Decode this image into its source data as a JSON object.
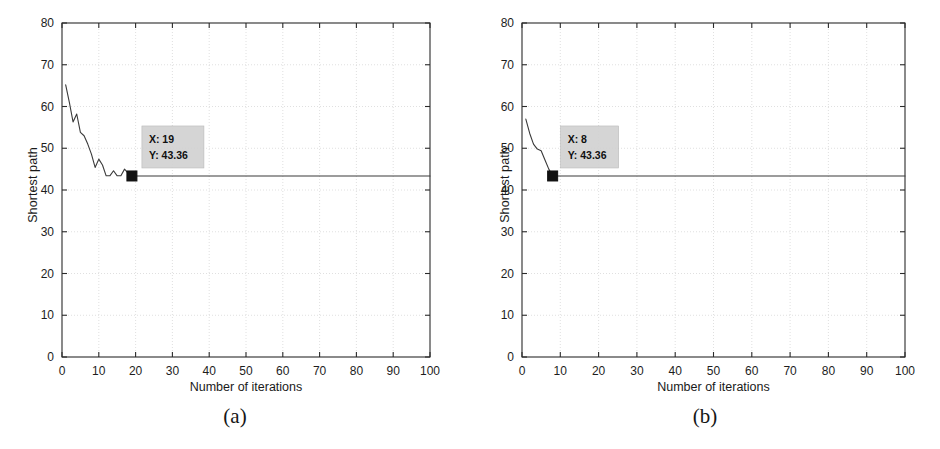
{
  "figure": {
    "panels": [
      {
        "id": "a",
        "caption": "(a)",
        "datatip": {
          "x_label": "X: 19",
          "y_label": "Y: 43.36"
        }
      },
      {
        "id": "b",
        "caption": "(b)",
        "datatip": {
          "x_label": "X: 8",
          "y_label": "Y: 43.36"
        }
      }
    ]
  },
  "chart_data": [
    {
      "type": "line",
      "panel": "a",
      "title": "",
      "xlabel": "Number of iterations",
      "ylabel": "Shortest path",
      "xlim": [
        0,
        100
      ],
      "ylim": [
        0,
        80
      ],
      "xticks": [
        0,
        10,
        20,
        30,
        40,
        50,
        60,
        70,
        80,
        90,
        100
      ],
      "yticks": [
        0,
        10,
        20,
        30,
        40,
        50,
        60,
        70,
        80
      ],
      "grid": true,
      "legend": "none",
      "line_color": "#3a3a3a",
      "marker": {
        "x": 19,
        "y": 43.36,
        "shape": "square",
        "color": "#111111"
      },
      "annotation": {
        "text": "X: 19\nY: 43.36",
        "x": 19,
        "y": 43.36
      },
      "x": [
        1,
        2,
        3,
        4,
        5,
        6,
        7,
        8,
        9,
        10,
        11,
        12,
        13,
        14,
        15,
        16,
        17,
        18,
        19,
        20,
        25,
        30,
        35,
        40,
        45,
        50,
        55,
        60,
        65,
        70,
        75,
        80,
        85,
        90,
        95,
        100
      ],
      "y": [
        65.2,
        61.0,
        56.3,
        58.2,
        53.8,
        53.0,
        51.0,
        48.6,
        45.4,
        47.4,
        46.0,
        43.4,
        43.4,
        44.6,
        43.4,
        43.4,
        45.0,
        44.0,
        43.36,
        43.36,
        43.36,
        43.36,
        43.36,
        43.36,
        43.36,
        43.36,
        43.36,
        43.36,
        43.36,
        43.36,
        43.36,
        43.36,
        43.36,
        43.36,
        43.36,
        43.36
      ]
    },
    {
      "type": "line",
      "panel": "b",
      "title": "",
      "xlabel": "Number of iterations",
      "ylabel": "Shortest path",
      "xlim": [
        0,
        100
      ],
      "ylim": [
        0,
        80
      ],
      "xticks": [
        0,
        10,
        20,
        30,
        40,
        50,
        60,
        70,
        80,
        90,
        100
      ],
      "yticks": [
        0,
        10,
        20,
        30,
        40,
        50,
        60,
        70,
        80
      ],
      "grid": true,
      "legend": "none",
      "line_color": "#3a3a3a",
      "marker": {
        "x": 8,
        "y": 43.36,
        "shape": "square",
        "color": "#111111"
      },
      "annotation": {
        "text": "X: 8\nY: 43.36",
        "x": 8,
        "y": 43.36
      },
      "x": [
        1,
        2,
        3,
        4,
        5,
        6,
        7,
        8,
        9,
        10,
        20,
        30,
        40,
        50,
        60,
        70,
        80,
        90,
        100
      ],
      "y": [
        57.0,
        53.6,
        51.0,
        49.8,
        49.4,
        47.2,
        45.0,
        43.36,
        43.36,
        43.36,
        43.36,
        43.36,
        43.36,
        43.36,
        43.36,
        43.36,
        43.36,
        43.36,
        43.36
      ]
    }
  ],
  "colors": {
    "axis": "#2b2b2b",
    "grid": "#d8d8d8",
    "line": "#3a3a3a",
    "marker": "#111111",
    "tip_bg": "#d2d2d2",
    "text": "#1a1a1a"
  }
}
